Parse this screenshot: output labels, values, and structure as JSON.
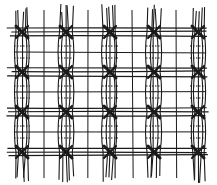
{
  "image": {
    "description": "Hand-drawn illustration of a woven grid of vertical warp threads and horizontal weft threads, tied with X-shaped knots at regular intersections, with dotted lines indicating hidden threads",
    "ink_color": "#1a1a1a",
    "background": "#ffffff",
    "knot_rows": 4,
    "knot_columns": 5
  }
}
